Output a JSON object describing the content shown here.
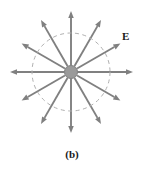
{
  "figure": {
    "caption": "(b)",
    "field_label": "E",
    "background_color": "#ffffff",
    "width": 144,
    "height": 171
  },
  "chart_data": {
    "type": "scatter",
    "title": "",
    "subtitle": "",
    "xlabel": "",
    "ylabel": "",
    "annotations": [
      {
        "text": "E",
        "x": 124,
        "y": 36,
        "bold": true,
        "meaning": "electric-field-vector-label"
      },
      {
        "text": "(b)",
        "x": 72,
        "y": 155,
        "bold": true,
        "meaning": "figure-part-caption"
      }
    ],
    "center": {
      "x": 71,
      "y": 72
    },
    "charge": {
      "label": "point-charge",
      "radius": 6.5,
      "fill": "#9a9a9a",
      "stroke": "#7d7d7d",
      "sign": "positive"
    },
    "dashed_circle": {
      "radius": 39,
      "stroke": "#b0b0b0",
      "dash": "4 3.5",
      "width": 1
    },
    "arrow_style": {
      "stroke": "#808080",
      "width": 1.9,
      "head_length": 7,
      "head_width": 5.5,
      "start_radius": 7
    },
    "arrows": [
      {
        "name": "field-line-0deg",
        "angle_deg": 0,
        "length": 62
      },
      {
        "name": "field-line-30deg",
        "angle_deg": 30,
        "length": 57
      },
      {
        "name": "field-line-60deg",
        "angle_deg": 60,
        "length": 60
      },
      {
        "name": "field-line-90deg",
        "angle_deg": 90,
        "length": 61
      },
      {
        "name": "field-line-120deg",
        "angle_deg": 120,
        "length": 60
      },
      {
        "name": "field-line-150deg",
        "angle_deg": 150,
        "length": 57
      },
      {
        "name": "field-line-180deg",
        "angle_deg": 180,
        "length": 61
      },
      {
        "name": "field-line-210deg",
        "angle_deg": 210,
        "length": 57
      },
      {
        "name": "field-line-240deg",
        "angle_deg": 240,
        "length": 60
      },
      {
        "name": "field-line-270deg",
        "angle_deg": 270,
        "length": 61
      },
      {
        "name": "field-line-300deg",
        "angle_deg": 300,
        "length": 60
      },
      {
        "name": "field-line-330deg",
        "angle_deg": 330,
        "length": 57
      }
    ],
    "legend": [],
    "grid": false
  }
}
